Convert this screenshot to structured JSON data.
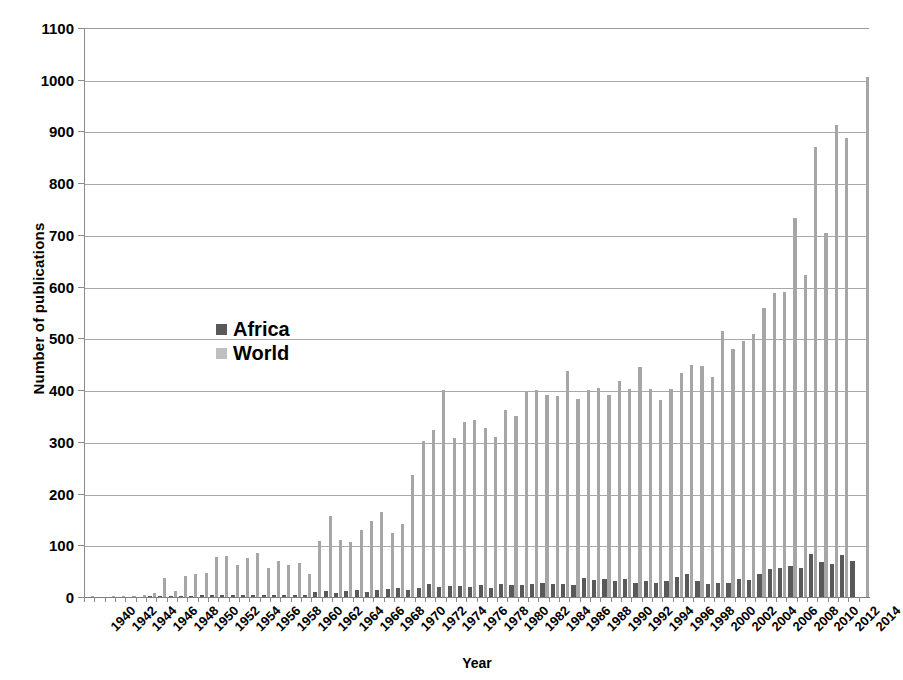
{
  "chart_data": {
    "type": "bar",
    "title": "",
    "xlabel": "Year",
    "ylabel": "Number of publications",
    "ylim": [
      0,
      1100
    ],
    "ytick_step": 100,
    "yticks": [
      0,
      100,
      200,
      300,
      400,
      500,
      600,
      700,
      800,
      900,
      1000,
      1100
    ],
    "grid": "horizontal",
    "legend_position": "inside-left",
    "xtick_labels": [
      "1940",
      "1942",
      "1944",
      "1946",
      "1948",
      "1950",
      "1952",
      "1954",
      "1956",
      "1958",
      "1960",
      "1962",
      "1964",
      "1966",
      "1968",
      "1970",
      "1972",
      "1974",
      "1976",
      "1978",
      "1980",
      "1982",
      "1984",
      "1986",
      "1988",
      "1990",
      "1992",
      "1994",
      "1996",
      "1998",
      "2000",
      "2002",
      "2004",
      "2006",
      "2008",
      "2010",
      "2012",
      "2014"
    ],
    "x": [
      1940,
      1941,
      1942,
      1943,
      1944,
      1945,
      1946,
      1947,
      1948,
      1949,
      1950,
      1951,
      1952,
      1953,
      1954,
      1955,
      1956,
      1957,
      1958,
      1959,
      1960,
      1961,
      1962,
      1963,
      1964,
      1965,
      1966,
      1967,
      1968,
      1969,
      1970,
      1971,
      1972,
      1973,
      1974,
      1975,
      1976,
      1977,
      1978,
      1979,
      1980,
      1981,
      1982,
      1983,
      1984,
      1985,
      1986,
      1987,
      1988,
      1989,
      1990,
      1991,
      1992,
      1993,
      1994,
      1995,
      1996,
      1997,
      1998,
      1999,
      2000,
      2001,
      2002,
      2003,
      2004,
      2005,
      2006,
      2007,
      2008,
      2009,
      2010,
      2011,
      2012,
      2013,
      2014,
      2015
    ],
    "series": [
      {
        "name": "Africa",
        "color": "#595959",
        "values": [
          0,
          0,
          0,
          0,
          0,
          0,
          1,
          2,
          1,
          2,
          2,
          3,
          3,
          3,
          3,
          3,
          3,
          3,
          3,
          3,
          3,
          3,
          9,
          11,
          8,
          12,
          13,
          10,
          14,
          16,
          18,
          13,
          18,
          25,
          20,
          22,
          21,
          20,
          23,
          18,
          25,
          24,
          23,
          25,
          28,
          26,
          25,
          24,
          36,
          32,
          35,
          31,
          35,
          27,
          31,
          27,
          31,
          38,
          45,
          30,
          26,
          28,
          27,
          34,
          33,
          45,
          54,
          57,
          59,
          57,
          84,
          68,
          64,
          82,
          69,
          0
        ]
      },
      {
        "name": "World",
        "color": "#a6a6a6",
        "values": [
          1,
          0,
          1,
          1,
          2,
          3,
          8,
          37,
          12,
          40,
          45,
          47,
          78,
          80,
          62,
          75,
          86,
          56,
          70,
          62,
          66,
          44,
          108,
          157,
          110,
          106,
          130,
          146,
          165,
          124,
          141,
          236,
          301,
          322,
          401,
          308,
          338,
          343,
          327,
          309,
          362,
          350,
          397,
          400,
          390,
          388,
          437,
          383,
          400,
          405,
          390,
          418,
          403,
          444,
          403,
          380,
          403,
          434,
          449,
          446,
          425,
          514,
          480,
          495,
          509,
          559,
          587,
          589,
          733,
          623,
          870,
          703,
          912,
          888,
          0,
          1005
        ]
      }
    ]
  },
  "axis": {
    "y_title": "Number of publications",
    "x_title": "Year"
  },
  "legend": {
    "items": [
      {
        "label": "Africa",
        "color": "#595959"
      },
      {
        "label": "World",
        "color": "#bfbfbf"
      }
    ]
  }
}
